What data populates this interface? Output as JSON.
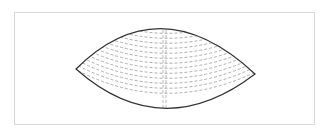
{
  "diagram": {
    "type": "lens-shape-with-contour-arcs",
    "frame": {
      "x": 14,
      "y": 12,
      "width": 301,
      "height": 113,
      "border_color": "#d8d8d8"
    },
    "outline": {
      "left_tip": [
        76,
        69
      ],
      "right_tip": [
        255,
        74
      ],
      "top_control": [
        160,
        -14
      ],
      "bottom_control": [
        162,
        145
      ],
      "stroke": "#333333",
      "stroke_width": 1.2
    },
    "contour_arcs": {
      "count": 15,
      "spacing": 5,
      "stroke": "#9a9a9a",
      "dash": "3,2"
    },
    "center_lines": {
      "x": [
        163,
        166
      ],
      "stroke": "#a8a8a8",
      "dash": "3,2"
    }
  }
}
